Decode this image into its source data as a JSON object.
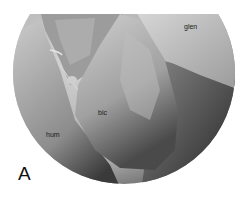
{
  "figure": {
    "panel_letter": "A",
    "labels": {
      "glen": "glen",
      "bic": "bic",
      "hum": "hum"
    }
  }
}
